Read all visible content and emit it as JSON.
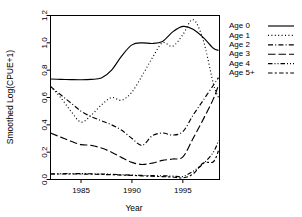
{
  "chart_data": {
    "type": "line",
    "title": "",
    "xlabel": "Year",
    "ylabel": "Smoothed Log(CPUE+1)",
    "xlim": [
      1982,
      1998.6
    ],
    "ylim": [
      0.0,
      1.2
    ],
    "xticks": [
      1985,
      1990,
      1995
    ],
    "xticklabels": [
      "1985",
      "1990",
      "1995"
    ],
    "yticks": [
      0.0,
      0.2,
      0.4,
      0.6,
      0.8,
      1.0,
      1.2
    ],
    "yticklabels": [
      "0.0",
      "0.2",
      "0.4",
      "0.6",
      "0.8",
      "1.0",
      "1.2"
    ],
    "grid": false,
    "legend_position": "right-outside",
    "x": [
      1982,
      1983,
      1984,
      1985,
      1986,
      1987,
      1988,
      1989,
      1990,
      1991,
      1992,
      1993,
      1994,
      1995,
      1996,
      1997,
      1998,
      1998.5
    ],
    "series": [
      {
        "name": "Age 0",
        "style": "solid",
        "values": [
          0.735,
          0.733,
          0.731,
          0.73,
          0.733,
          0.742,
          0.8,
          0.905,
          0.985,
          1.0,
          0.995,
          1.01,
          1.08,
          1.12,
          1.1,
          1.04,
          0.96,
          0.945
        ]
      },
      {
        "name": "Age 1",
        "style": "dotted",
        "values": [
          0.68,
          0.6,
          0.5,
          0.42,
          0.47,
          0.545,
          0.6,
          0.58,
          0.64,
          0.76,
          0.89,
          1.0,
          0.975,
          1.06,
          1.17,
          1.02,
          0.7,
          0.6
        ]
      },
      {
        "name": "Age 2",
        "style": "dashdot",
        "values": [
          0.68,
          0.62,
          0.56,
          0.5,
          0.46,
          0.43,
          0.4,
          0.36,
          0.3,
          0.25,
          0.32,
          0.34,
          0.325,
          0.35,
          0.47,
          0.58,
          0.69,
          0.745
        ]
      },
      {
        "name": "Age 3",
        "style": "longdash",
        "values": [
          0.34,
          0.31,
          0.28,
          0.255,
          0.25,
          0.23,
          0.2,
          0.16,
          0.125,
          0.11,
          0.12,
          0.14,
          0.15,
          0.165,
          0.3,
          0.44,
          0.59,
          0.69
        ]
      },
      {
        "name": "Age 4",
        "style": "dashdotdot",
        "values": [
          0.04,
          0.042,
          0.043,
          0.043,
          0.042,
          0.04,
          0.038,
          0.035,
          0.032,
          0.03,
          0.028,
          0.027,
          0.025,
          0.022,
          0.06,
          0.115,
          0.2,
          0.285
        ]
      },
      {
        "name": "Age 5+",
        "style": "dashdash",
        "values": [
          0.04,
          0.04,
          0.04,
          0.04,
          0.039,
          0.037,
          0.035,
          0.032,
          0.03,
          0.027,
          0.024,
          0.021,
          0.018,
          0.012,
          0.04,
          0.12,
          0.13,
          0.21
        ]
      }
    ]
  },
  "legend": {
    "entries": [
      {
        "label": "Age 0"
      },
      {
        "label": "Age 1"
      },
      {
        "label": "Age 2"
      },
      {
        "label": "Age 3"
      },
      {
        "label": "Age 4"
      },
      {
        "label": "Age 5+"
      }
    ]
  },
  "colors": {
    "foreground": "#000000",
    "background": "#ffffff"
  }
}
